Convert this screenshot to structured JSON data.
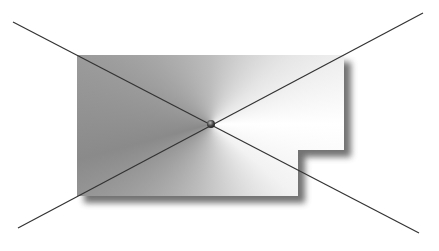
{
  "diagram": {
    "shape": {
      "points": [
        [
          77,
          55
        ],
        [
          344,
          55
        ],
        [
          344,
          150
        ],
        [
          298,
          150
        ],
        [
          298,
          196
        ],
        [
          77,
          196
        ]
      ],
      "shadow_offset": [
        7,
        7
      ],
      "shadow_color": "#5a5a5a",
      "gradient_center": [
        211,
        124
      ],
      "gradient_colors": {
        "dark": "#8a8a8a",
        "mid": "#bdbdbd",
        "light": "#ffffff"
      }
    },
    "lines": [
      {
        "id": "line-1",
        "from": [
          13,
          22
        ],
        "to": [
          419,
          233
        ],
        "color": "#333333"
      },
      {
        "id": "line-2",
        "from": [
          18,
          228
        ],
        "to": [
          423,
          13
        ],
        "color": "#333333"
      }
    ],
    "intersection_point": {
      "x": 211,
      "y": 124,
      "r": 4,
      "color": "#3a3a3a"
    }
  }
}
